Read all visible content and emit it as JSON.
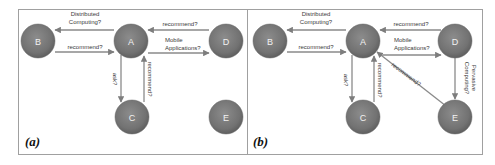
{
  "figure": {
    "panels": [
      {
        "id": "a",
        "label": "(a)",
        "nodes": [
          {
            "id": "B",
            "label": "B"
          },
          {
            "id": "A",
            "label": "A"
          },
          {
            "id": "D",
            "label": "D"
          },
          {
            "id": "C",
            "label": "C"
          },
          {
            "id": "E",
            "label": "E"
          }
        ],
        "edges": [
          {
            "from": "A",
            "to": "B",
            "label_line1": "Distributed",
            "label_line2": "Computing?"
          },
          {
            "from": "B",
            "to": "A",
            "label": "recommend?"
          },
          {
            "from": "D",
            "to": "A",
            "label": "recommend?"
          },
          {
            "from": "A",
            "to": "D",
            "label_line1": "Mobile",
            "label_line2": "Applications?"
          },
          {
            "from": "A",
            "to": "C",
            "label": "ask?"
          },
          {
            "from": "C",
            "to": "A",
            "label": "recommend?"
          }
        ]
      },
      {
        "id": "b",
        "label": "(b)",
        "nodes": [
          {
            "id": "B",
            "label": "B"
          },
          {
            "id": "A",
            "label": "A"
          },
          {
            "id": "D",
            "label": "D"
          },
          {
            "id": "C",
            "label": "C"
          },
          {
            "id": "E",
            "label": "E"
          }
        ],
        "edges": [
          {
            "from": "A",
            "to": "B",
            "label_line1": "Distributed",
            "label_line2": "Computing?"
          },
          {
            "from": "B",
            "to": "A",
            "label": "recommend?"
          },
          {
            "from": "D",
            "to": "A",
            "label": "recommend?"
          },
          {
            "from": "A",
            "to": "D",
            "label_line1": "Mobile",
            "label_line2": "Applications?"
          },
          {
            "from": "A",
            "to": "C",
            "label": "ask?"
          },
          {
            "from": "C",
            "to": "A",
            "label": "recommend?"
          },
          {
            "from": "E",
            "to": "A",
            "label": "recommend?"
          },
          {
            "from": "D",
            "to": "E",
            "label_line1": "Pervasive",
            "label_line2": "Computing?"
          }
        ]
      }
    ],
    "colors": {
      "node_fill": "#7a7a7a",
      "node_edge": "#5e5e5e",
      "edge_stroke": "#8a8a8a",
      "border": "#9a9a9a"
    }
  }
}
